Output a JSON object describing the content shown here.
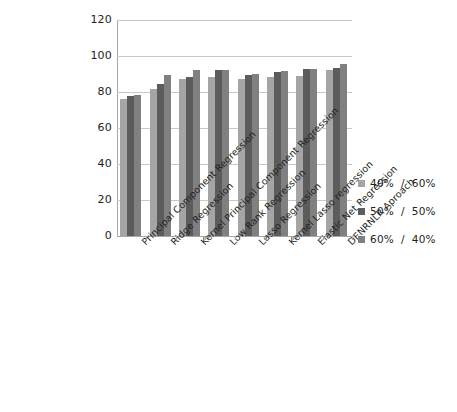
{
  "chart_data": {
    "type": "bar",
    "title": "",
    "xlabel": "",
    "ylabel": "",
    "ylim": [
      0,
      120
    ],
    "yticks": [
      0,
      20,
      40,
      60,
      80,
      100,
      120
    ],
    "ytick_labels": [
      "0",
      "20",
      "40",
      "60",
      "80",
      "100",
      "120"
    ],
    "grid": true,
    "legend_position": "right",
    "categories": [
      "Principal Component Regression",
      "Ridge Regression",
      "Kernel Principal Component Regression",
      "Low Rank Regression",
      "Lasso Regression",
      "Kernel Lasso regression",
      "Elastic Net Regression",
      "DENRNLR Aproach"
    ],
    "series": [
      {
        "name": "40%  /  60%",
        "color": "#a5a5a5",
        "values": [
          76,
          81.5,
          87.5,
          88.5,
          87,
          88.5,
          89,
          92.5
        ]
      },
      {
        "name": "50%  /  50%",
        "color": "#5c5c5c",
        "values": [
          78,
          84.5,
          88.5,
          92,
          89.5,
          91,
          93,
          93.5
        ]
      },
      {
        "name": "60%  /  40%",
        "color": "#808080",
        "values": [
          78.5,
          89.5,
          92,
          92.5,
          90,
          91.5,
          93,
          95.5
        ]
      }
    ]
  },
  "legend": {
    "items": [
      {
        "label": "40%  /  60%",
        "color": "#a5a5a5"
      },
      {
        "label": "50%  /  50%",
        "color": "#5c5c5c"
      },
      {
        "label": "60%  /  40%",
        "color": "#808080"
      }
    ]
  },
  "caption": {
    "text": ""
  }
}
